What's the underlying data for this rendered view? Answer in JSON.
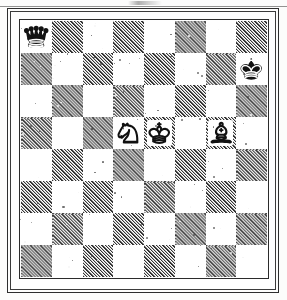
{
  "document": {
    "type": "chess-diagram",
    "title": "Chess position diagram",
    "source_look": "scanned printed book page"
  },
  "frame": {
    "style": "double-rule border",
    "outer_color": "#2e2e2e",
    "inner_color": "#3a3a3a",
    "page_color": "#fdfdfc"
  },
  "board": {
    "files": [
      "a",
      "b",
      "c",
      "d",
      "e",
      "f",
      "g",
      "h"
    ],
    "ranks": [
      "8",
      "7",
      "6",
      "5",
      "4",
      "3",
      "2",
      "1"
    ],
    "size": 8,
    "light_square_color": "#ffffff",
    "dark_square_color": "#9a9a9a",
    "dark_square_fill": "diagonal-hatch",
    "border_color": "#2b2b2b",
    "orientation": "white-bottom",
    "coordinates_shown": false
  },
  "position": {
    "fen": "q7/7k/8/3NKB2/8/8/8/8 w - - 0 1",
    "side_to_move": "white",
    "pieces": [
      {
        "square": "a8",
        "file": "a",
        "rank": "8",
        "color": "black",
        "type": "queen",
        "glyph": "black-queen-icon",
        "square_shade": "light"
      },
      {
        "square": "h7",
        "file": "h",
        "rank": "7",
        "color": "black",
        "type": "king",
        "glyph": "black-king-icon",
        "square_shade": "light"
      },
      {
        "square": "d5",
        "file": "d",
        "rank": "5",
        "color": "white",
        "type": "knight",
        "glyph": "white-knight-icon",
        "square_shade": "light"
      },
      {
        "square": "e5",
        "file": "e",
        "rank": "5",
        "color": "white",
        "type": "king",
        "glyph": "white-king-icon",
        "square_shade": "dark"
      },
      {
        "square": "g5",
        "file": "g",
        "rank": "5",
        "color": "white",
        "type": "bishop",
        "glyph": "white-bishop-icon",
        "square_shade": "dark"
      }
    ],
    "material": {
      "white": [
        "king",
        "knight",
        "bishop"
      ],
      "black": [
        "king",
        "queen"
      ]
    }
  },
  "artifacts": {
    "top_smudge": true,
    "top_rule": true,
    "speckle_noise": true
  }
}
